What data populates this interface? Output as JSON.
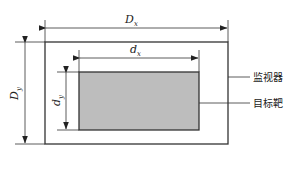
{
  "diagram": {
    "outer_rect": {
      "name": "monitor",
      "x": 45,
      "y": 42,
      "width": 183,
      "height": 102,
      "stroke": "#333333",
      "fill": "#ffffff"
    },
    "inner_rect": {
      "name": "target",
      "x": 79,
      "y": 72,
      "width": 120,
      "height": 58,
      "stroke": "#333333",
      "fill": "#bdbdbd"
    },
    "dimensions": {
      "Dx": {
        "main": "D",
        "sub": "x"
      },
      "dx": {
        "main": "d",
        "sub": "x"
      },
      "Dy": {
        "main": "D",
        "sub": "y"
      },
      "dy": {
        "main": "d",
        "sub": "y"
      }
    },
    "labels": {
      "monitor": "监视器",
      "target": "目标靶"
    },
    "colors": {
      "line": "#333333",
      "target_fill": "#bdbdbd",
      "background": "#ffffff"
    }
  }
}
